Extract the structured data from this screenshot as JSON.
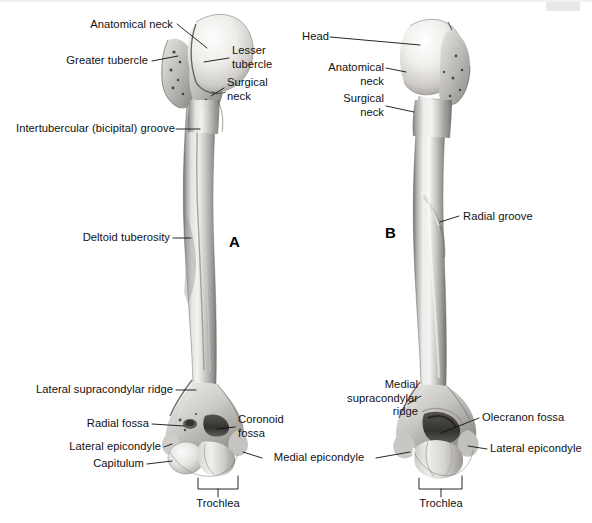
{
  "figure": {
    "background_color": "#ffffff",
    "ink_color": "#111111",
    "bone_color_light": "#f2f1ef",
    "bone_color_mid": "#b9b7b4",
    "bone_color_dark": "#7c7a77",
    "width": 592,
    "height": 523
  },
  "panels": [
    {
      "id": "A",
      "letter": "A",
      "view": "anterior"
    },
    {
      "id": "B",
      "letter": "B",
      "view": "posterior"
    }
  ],
  "labels": {
    "anatomical_neck_a": "Anatomical neck",
    "greater_tubercle": "Greater tubercle",
    "lesser_tubercle": "Lesser\ntubercle",
    "surgical_neck_a": "Surgical\nneck",
    "intertubercular_groove": "Intertubercular (bicipital) groove",
    "deltoid_tuberosity": "Deltoid tuberosity",
    "lateral_supracondylar_ridge": "Lateral supracondylar ridge",
    "radial_fossa": "Radial fossa",
    "lateral_epicondyle_a": "Lateral epicondyle",
    "capitulum": "Capitulum",
    "coronoid_fossa": "Coronoid\nfossa",
    "trochlea_a": "Trochlea",
    "medial_epicondyle": "Medial epicondyle",
    "head": "Head",
    "anatomical_neck_b": "Anatomical\nneck",
    "surgical_neck_b": "Surgical\nneck",
    "radial_groove": "Radial groove",
    "medial_supracondylar_ridge": "Medial\nsupracondylar\nridge",
    "olecranon_fossa": "Olecranon fossa",
    "lateral_epicondyle_b": "Lateral epicondyle",
    "trochlea_b": "Trochlea"
  }
}
